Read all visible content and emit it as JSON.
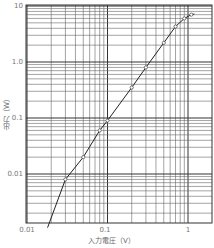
{
  "chart_data": {
    "type": "line",
    "title": "",
    "xlabel": "入力電圧（V）",
    "ylabel": "出力（W）",
    "xscale": "log",
    "yscale": "log",
    "xlim": [
      0.01,
      1.3
    ],
    "ylim": [
      0.001,
      10
    ],
    "x_ticks": [
      "0.01",
      "0.1",
      "1"
    ],
    "y_ticks": [
      "10",
      "1.0",
      "0.1",
      "0.01"
    ],
    "grid": true,
    "legend": null,
    "series": [
      {
        "name": "出力",
        "x": [
          0.018,
          0.03,
          0.05,
          0.08,
          0.1,
          0.2,
          0.3,
          0.5,
          0.7,
          0.9,
          1.1,
          1.2
        ],
        "y": [
          0.0011,
          0.008,
          0.02,
          0.06,
          0.09,
          0.35,
          0.8,
          2.2,
          4.3,
          6.0,
          7.0,
          7.2
        ],
        "markers": [
          false,
          true,
          true,
          true,
          true,
          true,
          true,
          true,
          true,
          true,
          true,
          false
        ]
      }
    ]
  },
  "labels": {
    "y_ticks": [
      "10",
      "1.0",
      "0.1",
      "0.01"
    ],
    "x_ticks": [
      "0.01",
      "0.1",
      "1"
    ],
    "xlabel": "入力電圧（V）",
    "ylabel": "出力（W）"
  }
}
